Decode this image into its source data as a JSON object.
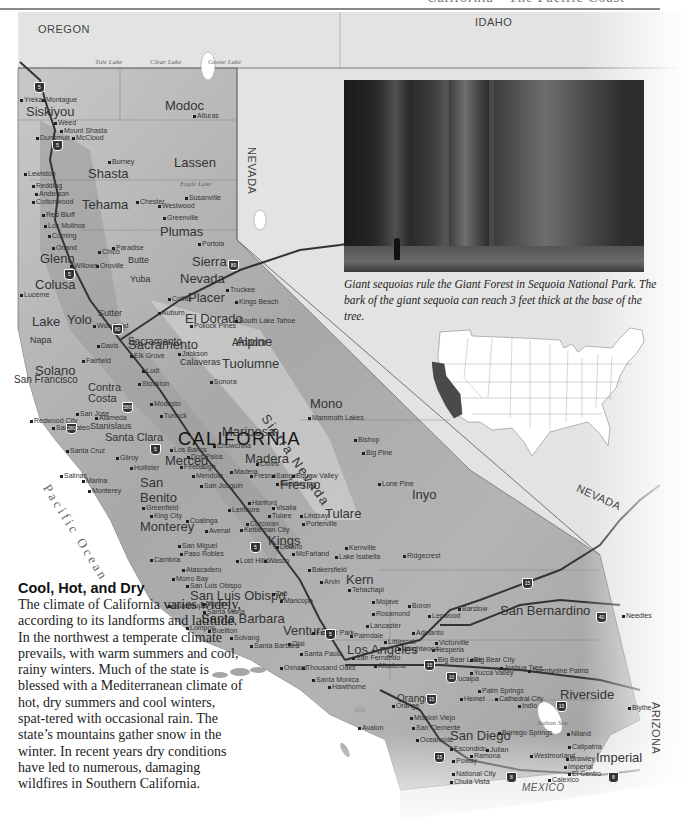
{
  "header": {
    "title": "California • The Pacific Coast"
  },
  "map": {
    "state_title": "CALIFORNIA",
    "neighbors": {
      "oregon": "OREGON",
      "idaho": "IDAHO",
      "nevada_north": "NEVADA",
      "nevada_south": "NEVADA",
      "arizona": "ARIZONA",
      "mexico": "MEXICO"
    },
    "water": {
      "ocean": "Pacific Ocean",
      "lakes": [
        "Tule Lake",
        "Clear Lake",
        "Goose Lake",
        "Eagle Lake",
        "Salton Sea"
      ]
    },
    "ranges": [
      "Sierra Nevada"
    ],
    "counties": [
      "Siskiyou",
      "Modoc",
      "Shasta",
      "Lassen",
      "Tehama",
      "Plumas",
      "Glenn",
      "Butte",
      "Sierra",
      "Colusa",
      "Nevada",
      "Placer",
      "Lake",
      "Yolo",
      "El Dorado",
      "Amador",
      "Alpine",
      "Napa",
      "Solano",
      "Sacramento",
      "Contra Costa",
      "Tuolumne",
      "Calaveras",
      "Mono",
      "Mariposa",
      "Madera",
      "Merced",
      "Stanislaus",
      "Santa Clara",
      "San Benito",
      "Fresno",
      "Tulare",
      "Inyo",
      "Monterey",
      "Kings",
      "Kern",
      "San Luis Obispo",
      "Santa Barbara",
      "Ventura",
      "Los Angeles",
      "San Bernardino",
      "Riverside",
      "Orange",
      "San Diego",
      "Imperial"
    ],
    "cities": [
      "Yreka",
      "Montague",
      "Weed",
      "Mount Shasta",
      "Dunsmuir",
      "McCloud",
      "Alturas",
      "Burney",
      "Lewiston",
      "Redding",
      "Anderson",
      "Cottonwood",
      "Red Bluff",
      "Los Molinos",
      "Corning",
      "Chester",
      "Westwood",
      "Susanville",
      "Greenville",
      "Orland",
      "Hamilton City",
      "Paradise",
      "Chico",
      "Oroville",
      "Portola",
      "Willows",
      "Gridley",
      "Biggs",
      "Live Oak",
      "Yuba City",
      "Marysville",
      "Olivehurst",
      "Grass Valley",
      "Truckee",
      "Williams",
      "Colusa",
      "Sutter",
      "Lincoln",
      "Wheatland",
      "Colfax",
      "Auburn",
      "Foresthill",
      "Kings Beach",
      "South Lake Tahoe",
      "Pollock Pines",
      "Lucerne",
      "Clearlake Oaks",
      "Lower Lake",
      "Woodland",
      "Davis",
      "Winters",
      "Vacaville",
      "Fairfield",
      "Suisun City",
      "Rio Vista",
      "Napa",
      "Calistoga",
      "Saint Helena",
      "Yountville",
      "Sacramento",
      "Elk Grove",
      "Galt",
      "Lodi",
      "Sutter Creek",
      "Jackson",
      "Angels Camp",
      "Jamestown",
      "Sonora",
      "Tuolumne",
      "San Andreas",
      "Stockton",
      "Manteca",
      "Modesto",
      "Turlock",
      "Oakdale",
      "Waterford",
      "Mariposa",
      "Oakhurst",
      "Madera",
      "Chowchilla",
      "Merced",
      "Atwater",
      "Los Banos",
      "Dos Palos",
      "Firebaugh",
      "Mendota",
      "San Joaquin",
      "Fresno",
      "Clovis",
      "Sanger",
      "Reedley",
      "Selma",
      "Kingsburg",
      "Dinuba",
      "Squaw Valley",
      "Hanford",
      "Lemoore",
      "Visalia",
      "Exeter",
      "Woodlake",
      "Tulare",
      "Lindsay",
      "Strathmore",
      "Porterville",
      "Terra Bella",
      "Richgrove",
      "Corcoran",
      "Avenal",
      "Coalinga",
      "Kettleman City",
      "Delano",
      "McFarland",
      "Wasco",
      "Shafter",
      "Bakersfield",
      "Lamont",
      "Arvin",
      "Tehachapi",
      "Taft",
      "Maricopa",
      "Buttonwillow",
      "Lost Hills",
      "Kernville",
      "Lake Isabella",
      "Bodfish",
      "Ridgecrest",
      "Mammoth Lakes",
      "Bishop",
      "Big Pine",
      "Lone Pine",
      "Mojave",
      "Boron",
      "Rosamond",
      "Lancaster",
      "Palmdale",
      "Acton",
      "Littlerock",
      "Adelanto",
      "Victorville",
      "Hesperia",
      "Wrightwood",
      "Barstow",
      "Lenwood",
      "Needles",
      "Big Bear Lake",
      "Big Bear City",
      "Yucca Valley",
      "Joshua Tree",
      "Twentynine Palms",
      "Yucaipa",
      "Palm Springs",
      "Cathedral City",
      "Indio",
      "Hemet",
      "Blythe",
      "Santa Maria",
      "Nipomo",
      "Guadalupe",
      "Lompoc",
      "Buellton",
      "Solvang",
      "Santa Ynez",
      "Santa Barbara",
      "Ojai",
      "Santa Paula",
      "Fillmore",
      "Oxnard",
      "Thousand Oaks",
      "Simi Valley",
      "Santa Monica",
      "Hawthorne",
      "San Fernando",
      "Los Angeles",
      "Altadena",
      "Ontario",
      "Riverside",
      "Anaheim",
      "Orange",
      "Irvine",
      "Mission Viejo",
      "San Clemente",
      "Oceanside",
      "Vista",
      "Escondido",
      "Ramona",
      "Julian",
      "Poway",
      "San Diego",
      "El Cajon",
      "Alpine",
      "National City",
      "Chula Vista",
      "Borrego Springs",
      "Niland",
      "Calipatria",
      "Westmorland",
      "Brawley",
      "Imperial",
      "El Centro",
      "Calexico",
      "Seeley",
      "Avalon",
      "San Francisco",
      "San Mateo",
      "Redwood City",
      "Alameda",
      "San Jose",
      "Campbell",
      "Gilroy",
      "Morgan Hill",
      "Hollister",
      "Watsonville",
      "Santa Cruz",
      "Scotts Valley",
      "Boulder Creek",
      "Castroville",
      "Marina",
      "Salinas",
      "Seaside",
      "Monterey",
      "Soledad",
      "Gonzales",
      "Greenfield",
      "King City",
      "San Miguel",
      "Paso Robles",
      "Templeton",
      "Atascadero",
      "Morro Bay",
      "San Luis Obispo",
      "Cambria",
      "Cayucos",
      "Livermore",
      "Tracy",
      "Newman",
      "Patterson",
      "Gustine",
      "Delhi",
      "Livingston"
    ]
  },
  "photo": {
    "alt": "Giant sequoia trunks with a person standing at the base",
    "caption": "Giant sequoias rule the Giant Forest in Sequoia National Park. The bark of the giant sequoia can reach 3 feet thick at the base of the tree."
  },
  "inset": {
    "description": "Map of the contiguous United States with California highlighted",
    "highlight_color": "#4a4a4a",
    "base_color": "#ffffff"
  },
  "sidebar": {
    "heading": "Cool, Hot, and Dry",
    "body": "The climate of California varies widely, according to its landforms and latitude. In the northwest a temperate climate prevails, with warm summers and cool, rainy winters. Much of the state is blessed with a Mediterranean climate of hot, dry summers and cool winters, spat-tered with occasional rain. The state’s mountains gather snow in the winter. In recent years dry conditions have led to numerous, damaging wildfires in Southern California."
  },
  "colors": {
    "land": "#b8b8b8",
    "land_dark": "#8c8c8c",
    "neighbor": "#e2e2e2",
    "water": "#ffffff",
    "roads": "#444444"
  },
  "labels": {
    "oregon": "OREGON",
    "idaho": "IDAHO",
    "nevada_n": "NEVADA",
    "nevada_s": "NEVADA",
    "arizona": "ARIZONA",
    "mexico": "MEXICO",
    "california": "CALIFORNIA",
    "sierra_nevada": "Sierra Nevada",
    "pacific_ocean": "Pacific Ocean",
    "tule_lake": "Tule Lake",
    "clear_lake": "Clear Lake",
    "goose_lake": "Goose Lake",
    "eagle_lake": "Eagle Lake",
    "salton_sea": "Salton Sea",
    "siskiyou": "Siskiyou",
    "modoc": "Modoc",
    "shasta": "Shasta",
    "lassen": "Lassen",
    "tehama": "Tehama",
    "plumas": "Plumas",
    "glenn": "Glenn",
    "butte": "Butte",
    "sierra": "Sierra",
    "colusa": "Colusa",
    "nevada": "Nevada",
    "placer": "Placer",
    "lake": "Lake",
    "yolo": "Yolo",
    "el_dorado": "El Dorado",
    "amador": "Amador",
    "alpine": "Alpine",
    "napa": "Napa",
    "solano": "Solano",
    "sutter": "Sutter",
    "yuba": "Yuba",
    "contra_costa": "Contra Costa",
    "tuolumne": "Tuolumne",
    "calaveras": "Calaveras",
    "mono": "Mono",
    "mariposa": "Mariposa",
    "madera": "Madera",
    "merced": "Merced",
    "stanislaus": "Stanislaus",
    "santa_clara": "Santa Clara",
    "san_benito": "San Benito",
    "fresno": "Fresno",
    "tulare": "Tulare",
    "inyo": "Inyo",
    "monterey": "Monterey",
    "kings": "Kings",
    "kern": "Kern",
    "slo": "San Luis Obispo",
    "santa_barbara": "Santa Barbara",
    "ventura": "Ventura",
    "los_angeles": "Los Angeles",
    "san_bernardino": "San Bernardino",
    "riverside": "Riverside",
    "orange": "Orange",
    "san_diego": "San Diego",
    "imperial": "Imperial",
    "san_francisco": "San Francisco",
    "sacramento": "Sacramento",
    "c_yreka": "Yreka",
    "c_montague": "Montague",
    "c_weed": "Weed",
    "c_mtshasta": "Mount Shasta",
    "c_dunsmuir": "Dunsmuir",
    "c_mccloud": "McCloud",
    "c_alturas": "Alturas",
    "c_burney": "Burney",
    "c_lewiston": "Lewiston",
    "c_redding": "Redding",
    "c_anderson": "Anderson",
    "c_cottonwood": "Cottonwood",
    "c_redbluff": "Red Bluff",
    "c_losmolinos": "Los Molinos",
    "c_corning": "Corning",
    "c_chester": "Chester",
    "c_westwood": "Westwood",
    "c_susanville": "Susanville",
    "c_greenville": "Greenville",
    "c_portola": "Portola",
    "c_orland": "Orland",
    "c_chico": "Chico",
    "c_paradise": "Paradise",
    "c_oroville": "Oroville",
    "c_willows": "Willows",
    "c_truckee": "Truckee",
    "c_kingsbeach": "Kings Beach",
    "c_slt": "South Lake Tahoe",
    "c_pollock": "Pollock Pines",
    "c_auburn": "Auburn",
    "c_colfax": "Colfax",
    "c_lucerne": "Lucerne",
    "c_woodland": "Woodland",
    "c_davis": "Davis",
    "c_fairfield": "Fairfield",
    "c_elkgrove": "Elk Grove",
    "c_lodi": "Lodi",
    "c_stockton": "Stockton",
    "c_jackson": "Jackson",
    "c_sonora": "Sonora",
    "c_modesto": "Modesto",
    "c_turlock": "Turlock",
    "c_mammoth": "Mammoth Lakes",
    "c_bishop": "Bishop",
    "c_bigpine": "Big Pine",
    "c_lonepine": "Lone Pine",
    "c_madera": "Madera",
    "c_chowchilla": "Chowchilla",
    "c_clovis": "Clovis",
    "c_fresno": "Fresno",
    "c_sanger": "Sanger",
    "c_reedley": "Reedley",
    "c_squaw": "Squaw Valley",
    "c_losbanos": "Los Banos",
    "c_dospalos": "Dos Palos",
    "c_firebaugh": "Firebaugh",
    "c_mendota": "Mendota",
    "c_sanjoaquin": "San Joaquin",
    "c_hanford": "Hanford",
    "c_lemoore": "Lemoore",
    "c_visalia": "Visalia",
    "c_tulare": "Tulare",
    "c_porterville": "Porterville",
    "c_lindsay": "Lindsay",
    "c_coalinga": "Coalinga",
    "c_avenal": "Avenal",
    "c_corcoran": "Corcoran",
    "c_kettleman": "Kettleman City",
    "c_delano": "Delano",
    "c_mcfarland": "McFarland",
    "c_wasco": "Wasco",
    "c_losthills": "Lost Hills",
    "c_bakersfield": "Bakersfield",
    "c_arvin": "Arvin",
    "c_tehachapi": "Tehachapi",
    "c_taft": "Taft",
    "c_maricopa": "Maricopa",
    "c_kernville": "Kernville",
    "c_isabella": "Lake Isabella",
    "c_ridgecrest": "Ridgecrest",
    "c_mojave": "Mojave",
    "c_boron": "Boron",
    "c_rosamond": "Rosamond",
    "c_lancaster": "Lancaster",
    "c_palmdale": "Palmdale",
    "c_littlerock": "Littlerock",
    "c_adelanto": "Adelanto",
    "c_victorville": "Victorville",
    "c_hesperia": "Hesperia",
    "c_wrightwood": "Wrightwood",
    "c_barstow": "Barstow",
    "c_lenwood": "Lenwood",
    "c_needles": "Needles",
    "c_bigbearlake": "Big Bear Lake",
    "c_bigbearcity": "Big Bear City",
    "c_yucca": "Yucca Valley",
    "c_joshua": "Joshua Tree",
    "c_29palms": "Twentynine Palms",
    "c_yucaipa": "Yucaipa",
    "c_palmsprings": "Palm Springs",
    "c_cathedral": "Cathedral City",
    "c_indio": "Indio",
    "c_hemet": "Hemet",
    "c_blythe": "Blythe",
    "c_salinas": "Salinas",
    "c_monterey": "Monterey",
    "c_marina": "Marina",
    "c_hollister": "Hollister",
    "c_gilroy": "Gilroy",
    "c_santacruz": "Santa Cruz",
    "c_greenfield": "Greenfield",
    "c_kingcity": "King City",
    "c_sanmiguel": "San Miguel",
    "c_pasorobles": "Paso Robles",
    "c_atascadero": "Atascadero",
    "c_morrobay": "Morro Bay",
    "c_slo": "San Luis Obispo",
    "c_cambria": "Cambria",
    "c_guadalupe": "Guadalupe",
    "c_nipomo": "Nipomo",
    "c_santamaria": "Santa Maria",
    "c_lompoc": "Lompoc",
    "c_buellton": "Buellton",
    "c_solvang": "Solvang",
    "c_sb": "Santa Barbara",
    "c_ojai": "Ojai",
    "c_santapaula": "Santa Paula",
    "c_oxnard": "Oxnard",
    "c_thousandoaks": "Thousand Oaks",
    "c_santamonica": "Santa Monica",
    "c_hawthorne": "Hawthorne",
    "c_sanfernando": "San Fernando",
    "c_altadena": "Altadena",
    "c_orange": "Orange",
    "c_missionviejo": "Mission Viejo",
    "c_sanclemente": "San Clemente",
    "c_oceanside": "Oceanside",
    "c_escondido": "Escondido",
    "c_ramona": "Ramona",
    "c_julian": "Julian",
    "c_poway": "Poway",
    "c_borrego": "Borrego Springs",
    "c_niland": "Niland",
    "c_calipatria": "Calipatria",
    "c_westmorland": "Westmorland",
    "c_brawley": "Brawley",
    "c_imperial": "Imperial",
    "c_elcentro": "El Centro",
    "c_calexico": "Calexico",
    "c_nationalcity": "National City",
    "c_chulavista": "Chula Vista",
    "c_avalon": "Avalon",
    "c_sanjose": "San Jose",
    "c_alameda": "Alameda",
    "c_sanmateo": "San Mateo",
    "c_redwood": "Redwood City",
    "c_fruitland": "Frazier Park"
  },
  "shields": {
    "i5": "5",
    "i80": "80",
    "i15": "15",
    "i40": "40",
    "i10": "10",
    "i8": "8",
    "i280": "280",
    "i580": "580"
  }
}
